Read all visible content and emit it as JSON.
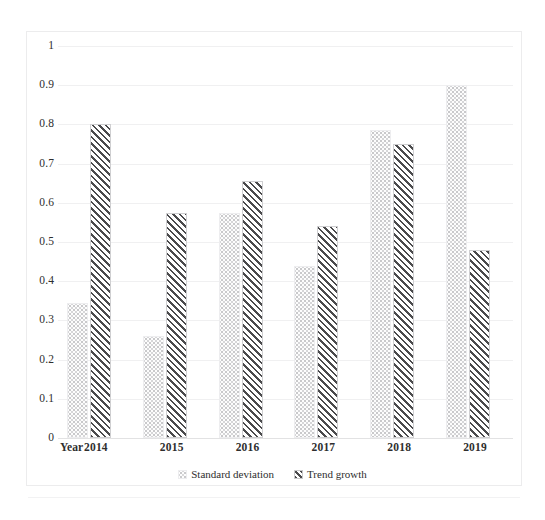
{
  "chart_data": {
    "type": "bar",
    "title": "",
    "xlabel": "Year",
    "ylabel": "",
    "categories": [
      "2014",
      "2015",
      "2016",
      "2017",
      "2018",
      "2019"
    ],
    "series": [
      {
        "name": "Standard deviation",
        "values": [
          0.345,
          0.26,
          0.575,
          0.44,
          0.785,
          0.9
        ],
        "swatch": "light-dotted"
      },
      {
        "name": "Trend growth",
        "values": [
          0.8,
          0.575,
          0.655,
          0.54,
          0.75,
          0.48
        ],
        "swatch": "dark-diagonal-hatch"
      }
    ],
    "ylim": [
      0,
      1
    ],
    "ytick_labels": [
      "0",
      "0.1",
      "0.2",
      "0.3",
      "0.4",
      "0.5",
      "0.6",
      "0.7",
      "0.8",
      "0.9",
      "1"
    ],
    "ytick_values": [
      0,
      0.1,
      0.2,
      0.3,
      0.4,
      0.5,
      0.6,
      0.7,
      0.8,
      0.9,
      1
    ],
    "grid": true,
    "legend_position": "bottom",
    "colors": {
      "standard_deviation": "#d6d6d8",
      "trend_growth": "#4a4a4c",
      "gridline": "#f0f0f1",
      "axis": "#e2e2e3",
      "text": "#2e2e2e",
      "background": "#ffffff"
    }
  },
  "legend": {
    "items": [
      {
        "label": "Standard deviation"
      },
      {
        "label": "Trend growth"
      }
    ]
  },
  "axis": {
    "x_title": "Year"
  }
}
